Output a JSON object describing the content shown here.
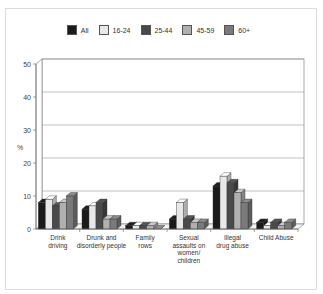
{
  "chart_data": {
    "type": "bar",
    "title": "",
    "xlabel": "",
    "ylabel": "%",
    "ylim": [
      0,
      50
    ],
    "yticks": [
      0,
      10,
      20,
      30,
      40,
      50
    ],
    "grid": true,
    "legend_position": "top",
    "categories": [
      [
        "Drink",
        "driving"
      ],
      [
        "Drunk and",
        "disorderly people"
      ],
      [
        "Family",
        "rows"
      ],
      [
        "Sexual",
        "assaults on",
        "women/",
        "children"
      ],
      [
        "Illegal",
        "drug abuse"
      ],
      [
        "Child Abuse"
      ]
    ],
    "series": [
      {
        "name": "All",
        "color": "#1a1a1a",
        "values": [
          8,
          6,
          1,
          3,
          13,
          2
        ]
      },
      {
        "name": "16-24",
        "color": "#e8e8e8",
        "values": [
          9,
          7,
          1,
          8,
          16,
          1
        ]
      },
      {
        "name": "25-44",
        "color": "#4a4a4a",
        "values": [
          7,
          8,
          1,
          3,
          14,
          2
        ]
      },
      {
        "name": "45-59",
        "color": "#b0b0b0",
        "values": [
          8,
          3,
          1,
          2,
          11,
          1
        ]
      },
      {
        "name": "60+",
        "color": "#7a7a7a",
        "values": [
          10,
          3,
          0,
          2,
          8,
          2
        ]
      }
    ]
  }
}
